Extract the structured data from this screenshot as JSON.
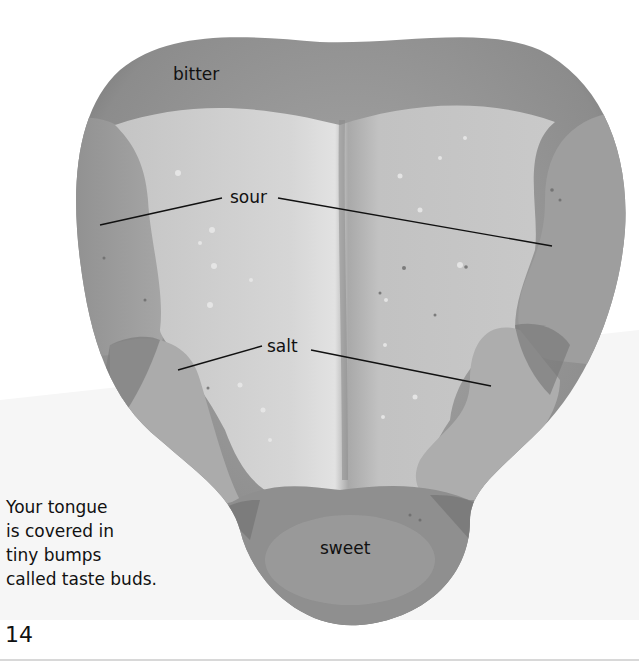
{
  "diagram": {
    "labels": {
      "bitter": "bitter",
      "sour": "sour",
      "salt": "salt",
      "sweet": "sweet"
    },
    "caption_lines": [
      "Your tongue",
      "is covered in",
      "tiny bumps",
      "called taste buds."
    ],
    "page_number": "14",
    "colors": {
      "background": "#ffffff",
      "tongue_outer": "#8a8a8a",
      "zone_bitter": "#999999",
      "zone_sour": "#9d9d9d",
      "zone_salt": "#b5b5b5",
      "zone_center": "#c8c8c8",
      "zone_sweet": "#8f8f8f",
      "leader_line": "#111111",
      "text": "#111111"
    }
  }
}
